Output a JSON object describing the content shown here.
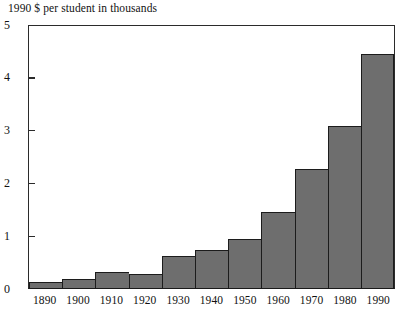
{
  "chart_data": {
    "type": "bar",
    "title": "1990 $ per student in thousands",
    "xlabel": "",
    "ylabel": "",
    "categories": [
      "1890",
      "1900",
      "1910",
      "1920",
      "1930",
      "1940",
      "1950",
      "1960",
      "1970",
      "1980",
      "1990"
    ],
    "values": [
      0.11,
      0.17,
      0.3,
      0.27,
      0.62,
      0.72,
      0.93,
      1.46,
      2.27,
      3.1,
      4.47
    ],
    "ylim": [
      0,
      5
    ],
    "xlim_note": "decades 1890 through 1990",
    "ytick_labels": [
      "0",
      "1",
      "2",
      "3",
      "4",
      "5"
    ],
    "ytick_values": [
      0,
      1,
      2,
      3,
      4,
      5
    ],
    "grid": false,
    "legend": false,
    "bar_color": "#6e6e6e",
    "bar_edge_color": "#1c1c1c",
    "axis_color": "#2b2b2b",
    "background_color": "#ffffff"
  }
}
